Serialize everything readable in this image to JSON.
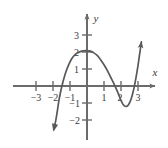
{
  "figure": {
    "name": "cubic-polynomial-graph",
    "background": "#ffffff",
    "axis_color": "#6b6b6b",
    "curve_color": "#595959",
    "label_color": "#3a3a3a"
  },
  "axes": {
    "x_label": "x",
    "y_label": "y",
    "x_ticks": [
      {
        "value": -3,
        "label": "−3"
      },
      {
        "value": -2,
        "label": "−2"
      },
      {
        "value": -1,
        "label": "−1"
      },
      {
        "value": 1,
        "label": "1"
      },
      {
        "value": 2,
        "label": "2"
      },
      {
        "value": 3,
        "label": "3"
      }
    ],
    "y_ticks": [
      {
        "value": 3,
        "label": "3"
      },
      {
        "value": 2,
        "label": "2"
      },
      {
        "value": 1,
        "label": "1"
      },
      {
        "value": -1,
        "label": "−1"
      },
      {
        "value": -2,
        "label": "−2"
      }
    ]
  },
  "chart_data": {
    "type": "line",
    "title": "",
    "xlabel": "x",
    "ylabel": "y",
    "xlim": [
      -3.6,
      3.6
    ],
    "ylim": [
      -2.6,
      3.4
    ],
    "grid": false,
    "legend": "none",
    "series": [
      {
        "name": "cubic curve",
        "x": [
          -1.95,
          -1.85,
          -1.75,
          -1.65,
          -1.5,
          -1.3,
          -1.1,
          -0.9,
          -0.7,
          -0.5,
          -0.3,
          -0.1,
          0.1,
          0.2,
          0.4,
          0.6,
          0.8,
          1.0,
          1.2,
          1.4,
          1.6,
          1.8,
          1.9,
          2.0,
          2.1,
          2.2,
          2.3,
          2.4,
          2.5,
          2.6,
          2.7,
          2.8,
          2.9,
          3.0,
          3.1,
          3.2
        ],
        "y": [
          -2.55,
          -2.1,
          -1.5,
          -0.85,
          -0.1,
          0.65,
          1.2,
          1.6,
          1.85,
          1.97,
          2.05,
          2.08,
          2.07,
          2.05,
          1.95,
          1.8,
          1.55,
          1.25,
          0.9,
          0.5,
          0.1,
          -0.35,
          -0.6,
          -0.85,
          -1.05,
          -1.17,
          -1.2,
          -1.15,
          -1.0,
          -0.75,
          -0.4,
          0.05,
          0.6,
          1.2,
          1.9,
          2.6
        ]
      }
    ],
    "annotations": {
      "local_max": {
        "x": 0.05,
        "y": 2.08
      },
      "local_min": {
        "x": 2.3,
        "y": -1.2
      },
      "x_intercepts": [
        -1.57,
        1.67,
        2.78
      ],
      "y_intercept": 2.07,
      "arrow_ends": [
        "down-left",
        "up-right"
      ]
    }
  }
}
